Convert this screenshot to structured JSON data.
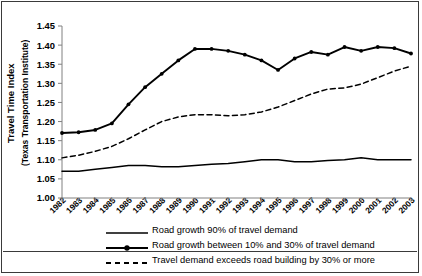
{
  "axis": {
    "y_label_line1": "Travel Time Index",
    "y_label_line2": "(Texas Transportation Institute)",
    "y_ticks": [
      "1.00",
      "1.05",
      "1.10",
      "1.15",
      "1.20",
      "1.25",
      "1.30",
      "1.35",
      "1.40",
      "1.45"
    ],
    "x_ticks": [
      "1982",
      "1983",
      "1984",
      "1985",
      "1986",
      "1987",
      "1988",
      "1989",
      "1990",
      "1991",
      "1992",
      "1993",
      "1994",
      "1995",
      "1996",
      "1997",
      "1998",
      "1999",
      "2000",
      "2001",
      "2002",
      "2003"
    ]
  },
  "legend": {
    "items": [
      {
        "label": "Road growth 90% of travel demand",
        "style": "solid-plain",
        "icon": "solid-line-swatch"
      },
      {
        "label": "Road growth between 10% and 30% of travel demand",
        "style": "solid-marker",
        "icon": "solid-line-marker-swatch"
      },
      {
        "label": "Travel demand exceeds road building by 30% or more",
        "style": "dashed",
        "icon": "dashed-line-swatch"
      }
    ]
  },
  "colors": {
    "line": "#000000",
    "axis": "#808080",
    "border": "#3a3a3a",
    "background": "#ffffff"
  },
  "chart_data": {
    "type": "line",
    "title": "",
    "xlabel": "",
    "ylabel": "Travel Time Index (Texas Transportation Institute)",
    "x": [
      1982,
      1983,
      1984,
      1985,
      1986,
      1987,
      1988,
      1989,
      1990,
      1991,
      1992,
      1993,
      1994,
      1995,
      1996,
      1997,
      1998,
      1999,
      2000,
      2001,
      2002,
      2003
    ],
    "ylim": [
      1.0,
      1.45
    ],
    "xlim": [
      1982,
      2003
    ],
    "grid": false,
    "legend_position": "bottom",
    "series": [
      {
        "name": "Road growth 90% of travel demand",
        "style": "solid",
        "markers": false,
        "values": [
          1.07,
          1.07,
          1.075,
          1.08,
          1.085,
          1.085,
          1.082,
          1.082,
          1.085,
          1.088,
          1.09,
          1.095,
          1.1,
          1.1,
          1.095,
          1.095,
          1.098,
          1.1,
          1.105,
          1.1,
          1.1,
          1.1
        ]
      },
      {
        "name": "Road growth between 10% and 30% of travel demand",
        "style": "solid",
        "markers": true,
        "values": [
          1.17,
          1.172,
          1.178,
          1.195,
          1.245,
          1.29,
          1.325,
          1.36,
          1.39,
          1.39,
          1.385,
          1.375,
          1.36,
          1.335,
          1.365,
          1.382,
          1.375,
          1.395,
          1.385,
          1.395,
          1.392,
          1.378
        ]
      },
      {
        "name": "Travel demand exceeds road building by 30% or more",
        "style": "dashed",
        "markers": false,
        "values": [
          1.105,
          1.112,
          1.122,
          1.135,
          1.155,
          1.178,
          1.2,
          1.212,
          1.218,
          1.218,
          1.215,
          1.218,
          1.225,
          1.238,
          1.255,
          1.272,
          1.285,
          1.288,
          1.298,
          1.315,
          1.332,
          1.345
        ]
      }
    ]
  }
}
